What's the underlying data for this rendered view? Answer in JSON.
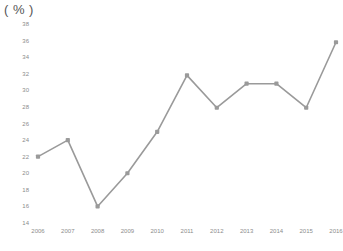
{
  "unit_label": "( % )",
  "chart_data": {
    "type": "line",
    "title": "",
    "subtitle": "",
    "xlabel": "",
    "ylabel": "( % )",
    "categories": [
      "2006",
      "2007",
      "2008",
      "2009",
      "2010",
      "2011",
      "2012",
      "2013",
      "2014",
      "2015",
      "2016"
    ],
    "values": [
      22.0,
      24.0,
      16.0,
      20.0,
      25.0,
      31.8,
      27.9,
      30.8,
      30.8,
      27.9,
      35.8
    ],
    "series": [
      {
        "name": "series-1",
        "values": [
          22.0,
          24.0,
          16.0,
          20.0,
          25.0,
          31.8,
          27.9,
          30.8,
          30.8,
          27.9,
          35.8
        ]
      }
    ],
    "ylim": [
      14,
      38
    ],
    "ytick_labels": [
      "38",
      "36",
      "34",
      "32",
      "30",
      "28",
      "26",
      "24",
      "22",
      "20",
      "18",
      "16",
      "14"
    ],
    "ytick_values": [
      38,
      36,
      34,
      32,
      30,
      28,
      26,
      24,
      22,
      20,
      18,
      16,
      14
    ],
    "xtick_labels": [
      "2006",
      "2007",
      "2008",
      "2009",
      "2010",
      "2011",
      "2012",
      "2013",
      "2014",
      "2015",
      "2016"
    ],
    "grid": false,
    "legend": false,
    "legend_position": "none",
    "marker": "square",
    "line_color": "#9a9a9a",
    "marker_color": "#9a9a9a",
    "tick_label_color": "#8c8c8c",
    "background_color": "#ffffff"
  }
}
